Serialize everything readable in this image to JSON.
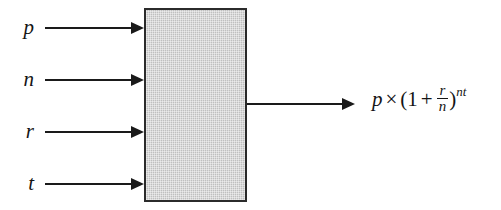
{
  "diagram": {
    "background_color": "#ffffff",
    "line_color": "#1a1a1a",
    "box": {
      "name": "process-box",
      "label": "",
      "fill_color": "#c9c9c9",
      "border_color": "#2b2b2b"
    },
    "inputs": [
      {
        "label": "p",
        "arrow": "right-arrow"
      },
      {
        "label": "n",
        "arrow": "right-arrow"
      },
      {
        "label": "r",
        "arrow": "right-arrow"
      },
      {
        "label": "t",
        "arrow": "right-arrow"
      }
    ],
    "output": {
      "arrow": "right-arrow",
      "expression_plain": "p × (1 + r/n)^nt",
      "parts": {
        "base": "p",
        "times": "×",
        "open_paren": "(",
        "one": "1",
        "plus": "+",
        "frac_numerator": "r",
        "frac_denominator": "n",
        "close_paren": ")",
        "exponent": "nt"
      }
    }
  }
}
